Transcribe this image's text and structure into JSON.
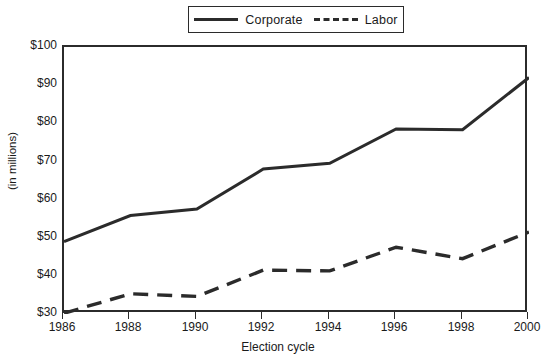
{
  "chart_data": {
    "type": "line",
    "title": "",
    "xlabel": "Election cycle",
    "ylabel": "(in millions)",
    "x": [
      1986,
      1988,
      1990,
      1992,
      1994,
      1996,
      1998,
      2000
    ],
    "categories": [
      "1986",
      "1988",
      "1990",
      "1992",
      "1994",
      "1996",
      "1998",
      "2000"
    ],
    "series": [
      {
        "name": "Corporate",
        "style": "solid",
        "color": "#2b2b2b",
        "values": [
          49,
          55.8,
          57.5,
          68,
          69.5,
          78.5,
          78.3,
          92
        ]
      },
      {
        "name": "Labor",
        "style": "dashed",
        "color": "#2b2b2b",
        "values": [
          30.2,
          35.3,
          34.6,
          41.5,
          41.3,
          47.5,
          44.5,
          51.5
        ]
      }
    ],
    "ylim": [
      30,
      100
    ],
    "yticks": [
      30,
      40,
      50,
      60,
      70,
      80,
      90,
      100
    ],
    "ytick_labels": [
      "$30",
      "$40",
      "$50",
      "$60",
      "$70",
      "$80",
      "$90",
      "$100"
    ],
    "xlim": [
      1986,
      2000
    ],
    "grid": false,
    "legend_position": "top-center"
  },
  "legend": {
    "entries": [
      {
        "label": "Corporate",
        "icon": "solid-line-swatch"
      },
      {
        "label": "Labor",
        "icon": "dashed-line-swatch"
      }
    ]
  }
}
